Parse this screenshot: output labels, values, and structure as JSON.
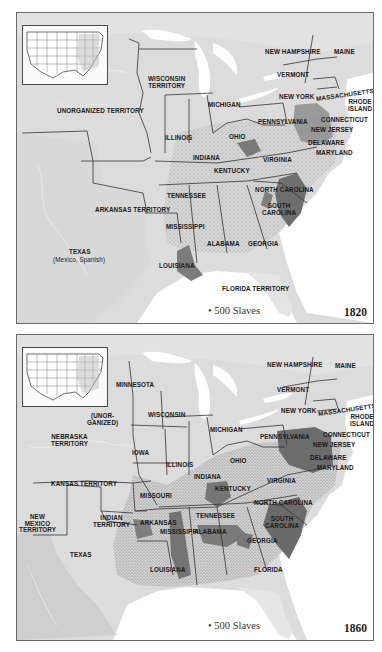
{
  "figure": {
    "legend_symbol": "dot",
    "colors": {
      "land": "#dcdcdc",
      "land_light": "#e8e8e8",
      "water": "#ffffff",
      "slave_dense": "#6e6e6e",
      "borders": "#333333"
    }
  },
  "maps": [
    {
      "year": "1820",
      "legend": "• 500 Slaves",
      "labels": {
        "wisconsin_territory": "WISCONSIN\nTERRITORY",
        "unorganized_territory": "UNORGANIZED TERRITORY",
        "michigan": "MICHIGAN",
        "illinois": "ILLINOIS",
        "indiana": "INDIANA",
        "ohio": "OHIO",
        "kentucky": "KENTUCKY",
        "virginia": "VIRGINIA",
        "tennessee": "TENNESSEE",
        "north_carolina": "NORTH CAROLINA",
        "south_carolina": "SOUTH\nCAROLINA",
        "georgia": "GEORGIA",
        "alabama": "ALABAMA",
        "mississippi": "MISSISSIPPI",
        "louisiana": "LOUISIANA",
        "arkansas_territory": "ARKANSAS TERRITORY",
        "texas": "TEXAS",
        "texas_note": "(Mexico, Spanish)",
        "florida_territory": "FLORIDA TERRITORY",
        "new_hampshire": "NEW HAMPSHIRE",
        "maine": "MAINE",
        "vermont": "VERMONT",
        "new_york": "NEW YORK",
        "massachusetts": "MASSACHUSETTS",
        "rhode_island": "RHODE\nISLAND",
        "connecticut": "CONNECTICUT",
        "pennsylvania": "PENNSYLVANIA",
        "new_jersey": "NEW JERSEY",
        "delaware": "DELAWARE",
        "maryland": "MARYLAND"
      }
    },
    {
      "year": "1860",
      "legend": "• 500 Slaves",
      "labels": {
        "minnesota": "MINNESOTA",
        "unorganized": "(UNOR-\nGANIZED)",
        "nebraska_territory": "NEBRASKA\nTERRITORY",
        "wisconsin": "WISCONSIN",
        "iowa": "IOWA",
        "michigan": "MICHIGAN",
        "illinois": "ILLINOIS",
        "indiana": "INDIANA",
        "ohio": "OHIO",
        "kansas_territory": "KANSAS TERRITORY",
        "missouri": "MISSOURI",
        "kentucky": "KENTUCKY",
        "virginia": "VIRGINIA",
        "tennessee": "TENNESSEE",
        "north_carolina": "NORTH CAROLINA",
        "south_carolina": "SOUTH\nCAROLINA",
        "georgia": "GEORGIA",
        "alabama": "ALABAMA",
        "mississippi": "MISSISSIPPI",
        "arkansas": "ARKANSAS",
        "louisiana": "LOUISIANA",
        "indian_territory": "INDIAN\nTERRITORY",
        "new_mexico_territory": "NEW\nMEXICO\nTERRITORY",
        "texas": "TEXAS",
        "florida": "FLORIDA",
        "new_hampshire": "NEW HAMPSHIRE",
        "maine": "MAINE",
        "vermont": "VERMONT",
        "new_york": "NEW YORK",
        "massachusetts": "MASSACHUSETTS",
        "rhode_island": "RHODE\nISLAND",
        "connecticut": "CONNECTICUT",
        "pennsylvania": "PENNSYLVANIA",
        "new_jersey": "NEW JERSEY",
        "delaware": "DELAWARE",
        "maryland": "MARYLAND"
      }
    }
  ]
}
